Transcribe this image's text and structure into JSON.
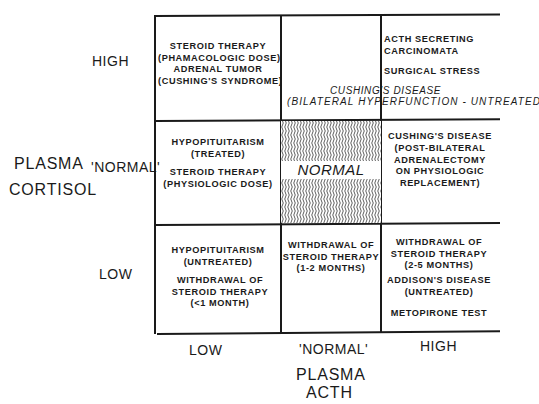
{
  "diagram": {
    "y_axis": {
      "title_line1": "PLASMA",
      "title_line2": "CORTISOL",
      "levels": [
        "HIGH",
        "'NORMAL'",
        "LOW"
      ]
    },
    "x_axis": {
      "title_line1": "PLASMA",
      "title_line2": "ACTH",
      "levels": [
        "LOW",
        "'NORMAL'",
        "HIGH"
      ]
    },
    "cells": {
      "high_low": "STEROID THERAPY\n(PHAMACOLOGIC DOSE)\nADRENAL TUMOR\n(CUSHING'S SYNDROME)",
      "high_normal": "",
      "high_high_1": "ACTH SECRETING\nCARCINOMATA",
      "high_high_2": "SURGICAL STRESS",
      "normal_low_1": "HYPOPITUITARISM\n(TREATED)",
      "normal_low_2": "STEROID THERAPY\n(PHYSIOLOGIC DOSE)",
      "normal_normal": "NORMAL",
      "normal_high": "CUSHING'S DISEASE\n(POST-BILATERAL\nADRENALECTOMY\nON PHYSIOLOGIC\nREPLACEMENT)",
      "low_low_1": "HYPOPITUITARISM\n(UNTREATED)",
      "low_low_2": "WITHDRAWAL OF\nSTEROID THERAPY\n(<1 MONTH)",
      "low_normal": "WITHDRAWAL OF\nSTEROID THERAPY\n(1-2 MONTHS)",
      "low_high_1": "WITHDRAWAL OF\nSTEROID THERAPY\n(2-5 MONTHS)",
      "low_high_2": "ADDISON'S DISEASE\n(UNTREATED)",
      "low_high_3": "METOPIRONE TEST"
    },
    "spanning_annotation": {
      "line1": "CUSHING'S DISEASE",
      "line2": "(BILATERAL HYPERFUNCTION - UNTREATED)"
    },
    "colors": {
      "ink": "#1a1a1a",
      "background": "#ffffff"
    }
  }
}
